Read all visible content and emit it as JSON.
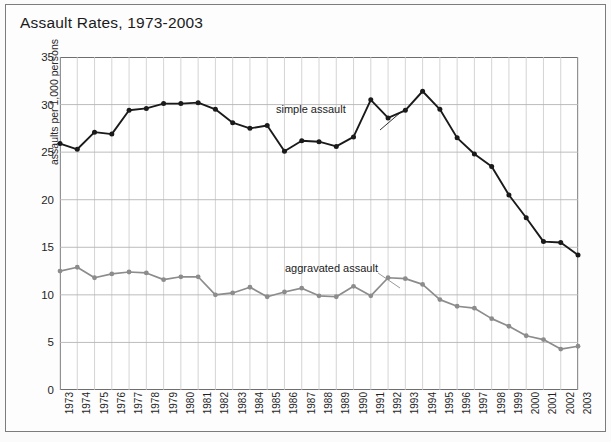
{
  "figure": {
    "title": "Assault Rates, 1973-2003"
  },
  "chart_data": {
    "type": "line",
    "title": "Assault Rates, 1973-2003",
    "xlabel": "",
    "ylabel": "assaults per 1,000 persons",
    "ylim": [
      0,
      35
    ],
    "yticks": [
      0,
      5,
      10,
      15,
      20,
      25,
      30,
      35
    ],
    "grid": true,
    "legend_position": "inline-annotations",
    "categories": [
      "1973",
      "1974",
      "1975",
      "1976",
      "1977",
      "1978",
      "1979",
      "1980",
      "1981",
      "1982",
      "1983",
      "1984",
      "1985",
      "1986",
      "1987",
      "1988",
      "1989",
      "1990",
      "1991",
      "1992",
      "1993",
      "1994",
      "1995",
      "1996",
      "1997",
      "1998",
      "1999",
      "2000",
      "2001",
      "2002",
      "2003"
    ],
    "series": [
      {
        "name": "simple assault",
        "color": "#1a1a1a",
        "marker": "circle",
        "values": [
          25.9,
          25.3,
          27.1,
          26.9,
          29.4,
          29.6,
          30.1,
          30.1,
          30.2,
          29.5,
          28.1,
          27.5,
          27.8,
          25.1,
          26.2,
          26.1,
          25.6,
          26.6,
          30.5,
          28.6,
          29.4,
          31.4,
          29.5,
          26.5,
          24.8,
          23.5,
          20.5,
          18.1,
          15.6,
          15.5,
          14.2
        ]
      },
      {
        "name": "aggravated assault",
        "color": "#8c8c8c",
        "marker": "circle",
        "values": [
          12.5,
          12.9,
          11.8,
          12.2,
          12.4,
          12.3,
          11.6,
          11.9,
          11.9,
          10.0,
          10.2,
          10.8,
          9.8,
          10.3,
          10.7,
          9.9,
          9.8,
          10.9,
          9.9,
          11.8,
          11.7,
          11.1,
          9.5,
          8.8,
          8.6,
          7.5,
          6.7,
          5.7,
          5.3,
          4.3,
          4.6
        ]
      }
    ],
    "annotations": [
      {
        "text": "simple assault",
        "attach_year": "1991"
      },
      {
        "text": "aggravated assault",
        "attach_year": "1993"
      }
    ]
  }
}
